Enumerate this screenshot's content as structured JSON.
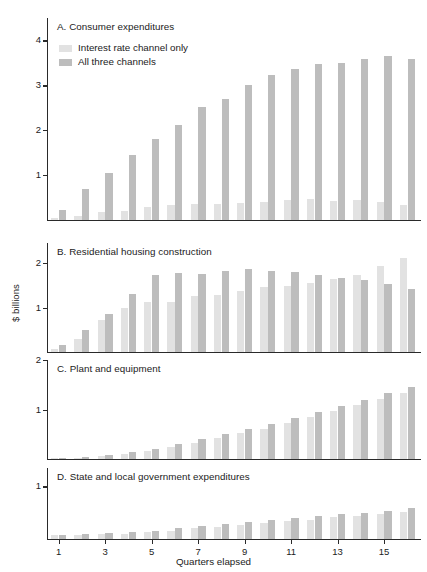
{
  "figure": {
    "ylabel": "$ billions",
    "xlabel": "Quarters elapsed",
    "legend": [
      {
        "key": "light",
        "label": "Interest rate channel only",
        "color": "#e2e2e2"
      },
      {
        "key": "dark",
        "label": "All three channels",
        "color": "#bdbdbd"
      }
    ]
  },
  "chart_data": {
    "type": "bar",
    "title": "",
    "xlabel": "Quarters elapsed",
    "ylabel": "$ billions",
    "grid": false,
    "legend_position": "top-left (panel A)",
    "categories": [
      1,
      2,
      3,
      4,
      5,
      6,
      7,
      8,
      9,
      10,
      11,
      12,
      13,
      14,
      15,
      16
    ],
    "xticks": [
      1,
      3,
      5,
      7,
      9,
      11,
      13,
      15
    ],
    "series_names": [
      "Interest rate channel only",
      "All three channels"
    ],
    "panels": [
      {
        "id": "A",
        "title": "A. Consumer expenditures",
        "ylim": [
          0,
          4.5
        ],
        "yticks": [
          1,
          2,
          3,
          4
        ],
        "series": [
          {
            "name": "Interest rate channel only",
            "values": [
              0.05,
              0.1,
              0.17,
              0.2,
              0.28,
              0.33,
              0.35,
              0.36,
              0.38,
              0.4,
              0.44,
              0.47,
              0.42,
              0.44,
              0.41,
              0.33
            ]
          },
          {
            "name": "All three channels",
            "values": [
              0.22,
              0.68,
              1.04,
              1.44,
              1.81,
              2.12,
              2.51,
              2.7,
              3.0,
              3.24,
              3.37,
              3.48,
              3.5,
              3.58,
              3.66,
              3.59
            ]
          }
        ]
      },
      {
        "id": "B",
        "title": "B. Residential housing construction",
        "ylim": [
          0,
          2.45
        ],
        "yticks": [
          1,
          2
        ],
        "series": [
          {
            "name": "Interest rate channel only",
            "values": [
              0.06,
              0.3,
              0.72,
              1.0,
              1.12,
              1.13,
              1.25,
              1.29,
              1.36,
              1.45,
              1.49,
              1.55,
              1.63,
              1.72,
              1.93,
              2.12
            ]
          },
          {
            "name": "All three channels",
            "values": [
              0.16,
              0.5,
              0.86,
              1.3,
              1.73,
              1.77,
              1.76,
              1.81,
              1.86,
              1.82,
              1.79,
              1.72,
              1.67,
              1.62,
              1.52,
              1.42
            ]
          }
        ]
      },
      {
        "id": "C",
        "title": "C. Plant and equipment",
        "ylim": [
          0,
          2.0
        ],
        "yticks": [
          1,
          2
        ],
        "series": [
          {
            "name": "Interest rate channel only",
            "values": [
              0.01,
              0.03,
              0.06,
              0.1,
              0.16,
              0.24,
              0.33,
              0.42,
              0.52,
              0.61,
              0.72,
              0.84,
              0.96,
              1.09,
              1.22,
              1.34
            ]
          },
          {
            "name": "All three channels",
            "values": [
              0.02,
              0.05,
              0.09,
              0.14,
              0.21,
              0.3,
              0.4,
              0.5,
              0.6,
              0.7,
              0.82,
              0.94,
              1.07,
              1.2,
              1.33,
              1.45
            ]
          }
        ]
      },
      {
        "id": "D",
        "title": "D. State and local government expenditures",
        "ylim": [
          0,
          1.35
        ],
        "yticks": [
          1
        ],
        "series": [
          {
            "name": "Interest rate channel only",
            "values": [
              0.07,
              0.07,
              0.09,
              0.1,
              0.13,
              0.16,
              0.2,
              0.23,
              0.27,
              0.31,
              0.34,
              0.37,
              0.41,
              0.44,
              0.48,
              0.51
            ]
          },
          {
            "name": "All three channels",
            "values": [
              0.08,
              0.09,
              0.11,
              0.13,
              0.16,
              0.2,
              0.25,
              0.29,
              0.33,
              0.37,
              0.4,
              0.44,
              0.47,
              0.5,
              0.54,
              0.58
            ]
          }
        ]
      }
    ]
  }
}
